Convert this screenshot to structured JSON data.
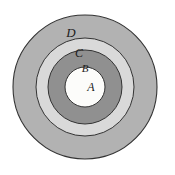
{
  "diagram": {
    "type": "concentric-circles-venn",
    "title": "",
    "background_color": "#ffffff",
    "outline_color": "#333333",
    "label_color": "#1a1a1a",
    "center": {
      "x": 85,
      "y": 87
    },
    "regions": [
      {
        "id": "D",
        "label": "D",
        "fill": "#b2b2b2",
        "radius": 72,
        "stroke_width": 1.1,
        "label_x": 71,
        "label_y": 34,
        "label_size": 13
      },
      {
        "id": "C",
        "label": "C",
        "fill": "#d9d9d9",
        "radius": 49,
        "stroke_width": 1.0,
        "label_x": 79,
        "label_y": 54,
        "label_size": 12
      },
      {
        "id": "B",
        "label": "B",
        "fill": "#909090",
        "radius": 37,
        "stroke_width": 1.0,
        "label_x": 85,
        "label_y": 69,
        "label_size": 11
      },
      {
        "id": "A",
        "label": "A",
        "fill": "#fcfcfa",
        "radius": 20,
        "stroke_width": 1.0,
        "label_x": 91,
        "label_y": 88,
        "label_size": 12
      }
    ]
  }
}
